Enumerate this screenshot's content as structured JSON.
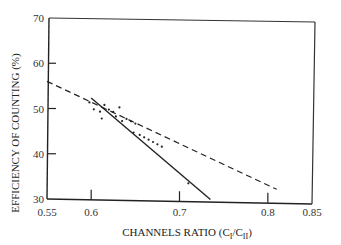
{
  "chart_data": {
    "type": "scatter",
    "title": "",
    "xlabel": "CHANNELS RATIO (C_I/C_II)",
    "xlabel_parts": {
      "main": "CHANNELS RATIO (C",
      "sub1": "I",
      "mid": "/C",
      "sub2": "II",
      "end": ")"
    },
    "ylabel": "EFFICIENCY OF COUNTING (%)",
    "xlim": [
      0.55,
      0.85
    ],
    "ylim": [
      30,
      70
    ],
    "x_ticks": [
      0.55,
      0.6,
      0.7,
      0.8,
      0.85
    ],
    "x_tick_labels": [
      "0.55",
      "0.6",
      "0.7",
      "0.8",
      "0.85"
    ],
    "y_ticks": [
      30,
      40,
      50,
      60,
      70
    ],
    "y_tick_labels": [
      "30",
      "40",
      "50",
      "60",
      "70"
    ],
    "grid": false,
    "legend": null,
    "series": [
      {
        "name": "dashed fit line",
        "style": "dashed",
        "x": [
          0.55,
          0.81
        ],
        "y": [
          56,
          33
        ]
      },
      {
        "name": "solid fit line",
        "style": "solid",
        "x": [
          0.6,
          0.735
        ],
        "y": [
          52.5,
          30.5
        ]
      },
      {
        "name": "measured points",
        "style": "points",
        "x": [
          0.598,
          0.603,
          0.61,
          0.612,
          0.615,
          0.62,
          0.625,
          0.628,
          0.632,
          0.635,
          0.64,
          0.645,
          0.648,
          0.65,
          0.655,
          0.66,
          0.665,
          0.67,
          0.675,
          0.68,
          0.71
        ],
        "y": [
          51.5,
          50,
          49.5,
          48,
          51,
          50,
          49.5,
          48.5,
          50.5,
          47.5,
          48,
          47.5,
          45,
          47,
          44.5,
          44,
          43.5,
          43,
          42.5,
          42,
          34
        ]
      }
    ]
  },
  "colors": {
    "ink": "#222222",
    "background": "#ffffff"
  }
}
